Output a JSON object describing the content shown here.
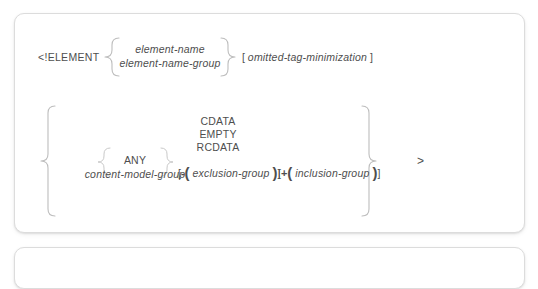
{
  "diagram": {
    "keyword": "<!ELEMENT",
    "terminator": ">",
    "name_group": {
      "options": [
        "element-name",
        "element-name-group"
      ]
    },
    "omitted_tag": {
      "open_bracket": "[",
      "label": "omitted-tag-minimization",
      "close_bracket": "]"
    },
    "content": {
      "keywords": [
        "CDATA",
        "EMPTY",
        "RCDATA"
      ],
      "alternatives": [
        "ANY",
        "content-model-group"
      ]
    },
    "exclusion": {
      "open_bracket": "[",
      "sign": "-",
      "open_paren": "(",
      "label": "exclusion-group",
      "close_paren": ")",
      "close_bracket": "]"
    },
    "inclusion": {
      "open_bracket": "[",
      "sign": "+",
      "open_paren": "(",
      "label": "inclusion-group",
      "close_paren": ")",
      "close_bracket": "]"
    }
  },
  "colors": {
    "text": "#4e4e4e",
    "brace": "#bdbdbd",
    "card_border": "#dcdcdc",
    "background": "#ffffff"
  }
}
